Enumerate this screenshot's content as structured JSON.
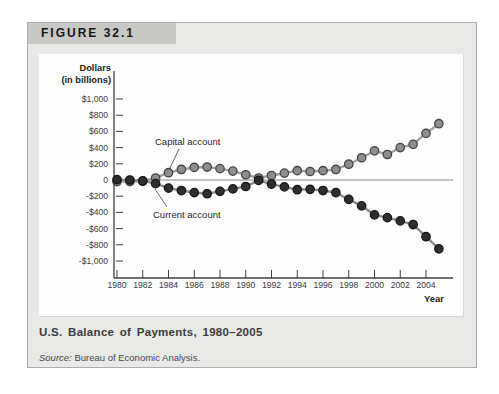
{
  "figure": {
    "label": "FIGURE 32.1",
    "title": "U.S. Balance of Payments, 1980–2005",
    "source_label": "Source:",
    "source_text": "Bureau of Economic Analysis.",
    "colors": {
      "panel_bg": "#e9e9e7",
      "header_bar_bg": "#c8c8c6",
      "chart_bg": "#fefefe"
    }
  },
  "chart_data": {
    "type": "line",
    "title": "U.S. Balance of Payments, 1980–2005",
    "xlabel": "Year",
    "ylabel": "Dollars (in billions)",
    "ylabel_lines": [
      "Dollars",
      "(in billions)"
    ],
    "ylim": [
      -1000,
      1000
    ],
    "ytick_step": 200,
    "grid": false,
    "legend": "inline-annotations",
    "x": [
      1980,
      1981,
      1982,
      1983,
      1984,
      1985,
      1986,
      1987,
      1988,
      1989,
      1990,
      1991,
      1992,
      1993,
      1994,
      1995,
      1996,
      1997,
      1998,
      1999,
      2000,
      2001,
      2002,
      2003,
      2004,
      2005
    ],
    "xtick_labels": [
      "1980",
      "1982",
      "1984",
      "1986",
      "1988",
      "1990",
      "1992",
      "1994",
      "1996",
      "1998",
      "2000",
      "2002",
      "2004"
    ],
    "ytick_values": [
      1000,
      800,
      600,
      400,
      200,
      0,
      -200,
      -400,
      -600,
      -800,
      -1000
    ],
    "ytick_labels": [
      "$1,000",
      "$800",
      "$600",
      "$400",
      "$200",
      "0",
      "-$200",
      "-$400",
      "-$600",
      "-$800",
      "-$1,000"
    ],
    "series": [
      {
        "name": "Capital account",
        "values": [
          -20,
          -20,
          -15,
          25,
          90,
          130,
          155,
          160,
          140,
          110,
          65,
          25,
          55,
          85,
          115,
          105,
          115,
          130,
          195,
          275,
          360,
          315,
          400,
          440,
          575,
          695
        ],
        "dot_fill": "#8e8e8e",
        "dot_stroke": "#454545",
        "line_color": "#a0a0a0"
      },
      {
        "name": "Current account",
        "values": [
          5,
          0,
          -10,
          -45,
          -100,
          -130,
          -155,
          -170,
          -140,
          -110,
          -80,
          -5,
          -50,
          -85,
          -120,
          -115,
          -130,
          -155,
          -240,
          -320,
          -430,
          -465,
          -505,
          -550,
          -700,
          -850
        ],
        "dot_fill": "#2e2e2e",
        "dot_stroke": "#161616",
        "line_color": "#8a8a8a"
      }
    ],
    "axis_color": "#3f3f3f",
    "zero_line_color": "#8a8a8a"
  }
}
